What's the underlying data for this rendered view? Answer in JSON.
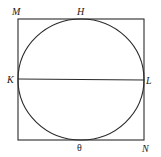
{
  "diagram": {
    "colors": {
      "line": "#2a2a2a",
      "text": "#1a1a1a",
      "background": "#ffffff"
    },
    "square": {
      "corners": {
        "top_left": "M",
        "bottom_right": "N"
      },
      "x": 18,
      "y": 19,
      "width": 126,
      "height": 121
    },
    "circle": {
      "cx": 81,
      "cy": 79.5,
      "rx": 63,
      "ry": 60.5
    },
    "diameter": {
      "from": "K",
      "to": "L",
      "x1": 18,
      "y1": 79,
      "x2": 144,
      "y2": 80
    },
    "labels": {
      "M": "M",
      "H": "H",
      "K": "K",
      "L": "L",
      "theta": "θ",
      "N": "N"
    }
  }
}
